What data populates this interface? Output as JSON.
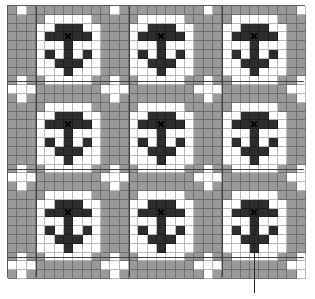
{
  "chart": {
    "type": "knitting-colorwork-chart",
    "columns": 32,
    "rows": 31,
    "repeat": {
      "width": 10,
      "height": 10
    },
    "colors": {
      "background": "#9a9a9a",
      "frame": "#ffffff",
      "motif": "#2e2e2e",
      "gridline": "#6e6e6e"
    },
    "motif_cells_note": "local coords (col,row) within 10x10 repeat",
    "frame": {
      "rows": {
        "1": [
          4,
          5,
          6,
          7,
          8
        ],
        "2": [
          3,
          4,
          5,
          6,
          7,
          8,
          9
        ],
        "3": [
          3,
          4,
          5,
          6,
          7,
          8,
          9
        ],
        "4": [
          3,
          4,
          5,
          6,
          7,
          8,
          9
        ],
        "5": [
          3,
          4,
          5,
          6,
          7,
          8,
          9
        ],
        "6": [
          3,
          4,
          5,
          6,
          7,
          8,
          9
        ],
        "7": [
          3,
          4,
          5,
          6,
          7,
          8,
          9
        ],
        "8": [
          4,
          5,
          6,
          7,
          8
        ]
      }
    },
    "dark": {
      "rows": {
        "2": [
          5,
          6,
          7
        ],
        "3": [
          4,
          5,
          6,
          7,
          8
        ],
        "4": [
          6
        ],
        "5": [
          4,
          6,
          8
        ],
        "6": [
          5,
          6,
          7
        ],
        "7": [
          6
        ]
      }
    },
    "x_mark": {
      "col": 6,
      "row": 3
    },
    "plus": {
      "center_col": 1,
      "center_row": 9
    },
    "motif_count": 9
  },
  "annotation": {
    "leader_target": "bottom-right motif center",
    "label": ""
  }
}
